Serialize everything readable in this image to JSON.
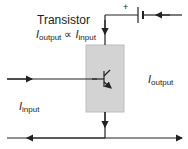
{
  "diagram": {
    "title": "Transistor",
    "relation": {
      "lhs_symbol": "I",
      "lhs_sub": "output",
      "operator": "∝",
      "rhs_symbol": "I",
      "rhs_sub": "input"
    },
    "labels": {
      "output": {
        "symbol": "I",
        "sub": "output"
      },
      "input": {
        "symbol": "I",
        "sub": "input"
      }
    },
    "battery": {
      "polarity": "+"
    },
    "colors": {
      "box_fill": "#d3d3d3",
      "box_stroke": "#bdbdbd",
      "wire": "#222222"
    }
  }
}
